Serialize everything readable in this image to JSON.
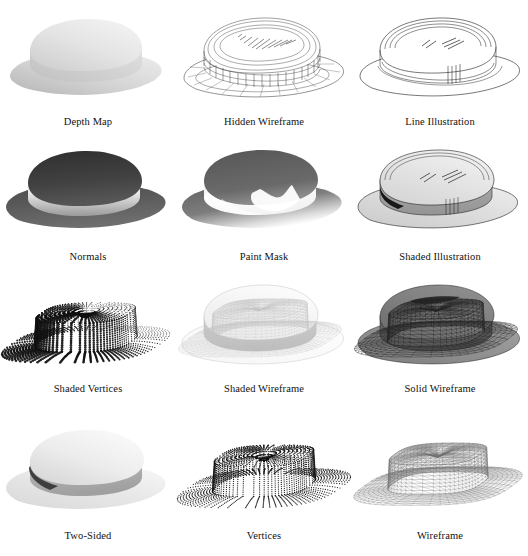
{
  "figure": {
    "background_color": "#ffffff",
    "caption_color": "#111111",
    "columns": 3,
    "rows": 4
  },
  "cells": [
    {
      "index": 1,
      "caption": "Depth Map",
      "style_key": "depth-map",
      "row": 1,
      "column": 1,
      "description": "Smooth grayscale depth-shaded hat, light gray, no outlines",
      "colors": {
        "near": "#f2f2f2",
        "far": "#a8a8a8",
        "outline": "none"
      }
    },
    {
      "index": 2,
      "caption": "Hidden Wireframe",
      "style_key": "hidden-wireframe",
      "row": 1,
      "column": 2,
      "description": "White surface with all mesh edges drawn including hidden lines",
      "colors": {
        "fill": "#ffffff",
        "line": "#333333",
        "outline": "#111111"
      }
    },
    {
      "index": 3,
      "caption": "Line Illustration",
      "style_key": "line-illustration",
      "row": 1,
      "column": 3,
      "description": "Clean outline drawing with silhouette and crease lines only",
      "colors": {
        "fill": "#ffffff",
        "line": "#222222",
        "outline": "#111111"
      }
    },
    {
      "index": 4,
      "caption": "Normals",
      "style_key": "normals",
      "row": 2,
      "column": 1,
      "description": "Surface normal direction mapped to grayscale, dark top and brim",
      "colors": {
        "light": "#f0f0f0",
        "dark": "#4a4a4a",
        "outline": "none"
      }
    },
    {
      "index": 5,
      "caption": "Paint Mask",
      "style_key": "paint-mask",
      "row": 2,
      "column": 1,
      "description": "High-contrast specular paint mask with dark top and bright highlights",
      "colors": {
        "light": "#ffffff",
        "dark": "#585858",
        "outline": "none"
      }
    },
    {
      "index": 6,
      "caption": "Shaded Illustration",
      "style_key": "shaded-illustration",
      "row": 2,
      "column": 3,
      "description": "Flat-shaded light gray surfaces combined with black outlines",
      "colors": {
        "fill": "#dcdcdc",
        "line": "#222222",
        "outline": "#111111"
      }
    },
    {
      "index": 7,
      "caption": "Shaded Vertices",
      "style_key": "shaded-vertices",
      "row": 3,
      "column": 1,
      "description": "Mesh vertices drawn as dots, shaded so dot size follows lighting",
      "colors": {
        "dot": "#111111",
        "background": "#ffffff"
      }
    },
    {
      "index": 8,
      "caption": "Shaded Wireframe",
      "style_key": "shaded-wireframe",
      "row": 3,
      "column": 2,
      "description": "Light shaded surface with fine light-gray triangle mesh overlay",
      "colors": {
        "fill": "#f4f4f4",
        "line": "#b9b9b9",
        "outline": "#cfcfcf"
      }
    },
    {
      "index": 9,
      "caption": "Solid Wireframe",
      "style_key": "solid-wireframe",
      "row": 3,
      "column": 3,
      "description": "Dark shaded solid with dense dark triangle mesh drawn on top",
      "colors": {
        "fill": "#8a8a8a",
        "line": "#2a2a2a",
        "outline": "#1a1a1a"
      }
    },
    {
      "index": 10,
      "caption": "Two-Sided",
      "style_key": "two-sided",
      "row": 4,
      "column": 1,
      "description": "Smooth two-sided lighting, bright crown with visible dark inner band",
      "colors": {
        "light": "#ededed",
        "dark": "#8f8f8f",
        "inner": "#4f4f4f"
      }
    },
    {
      "index": 11,
      "caption": "Vertices",
      "style_key": "vertices",
      "row": 4,
      "column": 2,
      "description": "All mesh vertices drawn as uniform small black dots",
      "colors": {
        "dot": "#111111",
        "background": "#ffffff"
      }
    },
    {
      "index": 12,
      "caption": "Wireframe",
      "style_key": "wireframe",
      "row": 4,
      "column": 3,
      "description": "Mid-gray triangle wireframe, all edges visible, no surface fill",
      "colors": {
        "line": "#6b6b6b",
        "outline": "#3a3a3a"
      }
    }
  ]
}
